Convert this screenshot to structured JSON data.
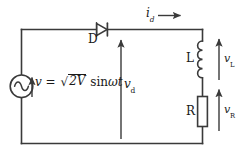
{
  "diagram": {
    "type": "circuit-schematic",
    "colors": {
      "wire": "#3a3a3a",
      "text": "#1a1a1a",
      "background": "#ffffff",
      "component_fill": "#ffffff"
    }
  },
  "components": {
    "source": {
      "name": "ac-voltage-source",
      "symbol": "circle-with-sine",
      "label": "v = √2V sin ωt",
      "label_parts": {
        "variable": "v",
        "equals": "=",
        "radicand": "2V",
        "trig": "sin",
        "omega": "ω",
        "time": "t"
      }
    },
    "diode": {
      "name": "diode",
      "symbol": "triangle-with-bar",
      "label": "D",
      "orientation": "anode-left-cathode-right"
    },
    "inductor": {
      "name": "inductor",
      "symbol": "coil",
      "label": "L",
      "turns": 4
    },
    "resistor": {
      "name": "resistor",
      "symbol": "rectangle",
      "label": "R"
    }
  },
  "annotations": {
    "current": {
      "name": "load-current",
      "symbol": "i",
      "subscript": "d",
      "direction": "right"
    },
    "vd": {
      "name": "output-voltage",
      "symbol": "v",
      "subscript": "d",
      "direction": "up"
    },
    "vL": {
      "name": "inductor-voltage",
      "symbol": "v",
      "subscript": "L",
      "direction": "up"
    },
    "vR": {
      "name": "resistor-voltage",
      "symbol": "v",
      "subscript": "R",
      "direction": "up"
    },
    "source_arrow": {
      "name": "source-voltage-arrow",
      "direction": "up"
    }
  }
}
